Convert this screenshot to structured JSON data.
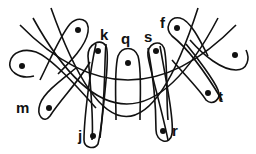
{
  "diagram": {
    "arcs": [
      {
        "name": "inner-arc",
        "path": "M20,25 Q128,135 236,25"
      },
      {
        "name": "middle-arc",
        "path": "M33,18 Q128,190 218,18"
      },
      {
        "name": "outer-arc",
        "path": "M51,8 Q128,225 198,8"
      }
    ],
    "loops": [
      {
        "name": "loop-left",
        "label": "",
        "dot": [
          22,
          66
        ],
        "path": "M34,76 C18,80 8,70 10,62 C12,52 24,48 36,52 C52,58 80,90 96,108"
      },
      {
        "name": "loop-top-left",
        "label": "",
        "dot": [
          78,
          30
        ],
        "path": "M40,80 C50,60 60,36 70,24 C78,16 90,18 88,32 C86,46 70,62 58,74"
      },
      {
        "name": "loop-m",
        "label": "m",
        "dot": [
          49,
          108
        ],
        "label_pos": [
          16,
          113
        ],
        "path": "M90,62 C80,80 60,100 50,116 C44,124 36,116 40,104 C44,92 64,78 76,68"
      },
      {
        "name": "loop-k",
        "label": "k",
        "dot": [
          98,
          51
        ],
        "label_pos": [
          100,
          40
        ],
        "path": "M92,140 C94,120 90,80 88,56 C88,44 100,38 106,46 C110,54 104,100 100,138"
      },
      {
        "name": "loop-j",
        "label": "j",
        "dot": [
          93,
          136
        ],
        "label_pos": [
          77,
          141
        ],
        "path": "M106,44 C104,60 106,110 98,144 C94,150 84,148 84,140 C84,120 90,70 96,44"
      },
      {
        "name": "loop-q",
        "label": "q",
        "dot": [
          128,
          63
        ],
        "label_pos": [
          121,
          44
        ],
        "path": "M116,120 C116,100 114,70 118,56 C122,46 134,46 138,56 C142,70 140,100 140,120"
      },
      {
        "name": "loop-s",
        "label": "s",
        "dot": [
          156,
          51
        ],
        "label_pos": [
          144,
          42
        ],
        "path": "M168,140 C162,110 150,70 148,56 C146,44 160,38 164,48 C168,60 166,100 168,120"
      },
      {
        "name": "loop-r",
        "label": "r",
        "dot": [
          163,
          131
        ],
        "label_pos": [
          172,
          136
        ],
        "path": "M148,48 C154,80 156,110 156,130 C156,142 170,146 172,134 C174,120 166,80 160,46"
      },
      {
        "name": "loop-f",
        "label": "f",
        "dot": [
          177,
          28
        ],
        "label_pos": [
          160,
          28
        ],
        "path": "M222,100 C210,80 190,50 172,36 C164,28 170,16 180,18 C190,20 200,40 208,56"
      },
      {
        "name": "loop-t",
        "label": "t",
        "dot": [
          208,
          93
        ],
        "label_pos": [
          218,
          102
        ],
        "path": "M172,60 C184,74 200,90 206,100 C212,106 222,100 218,90 C214,80 196,56 186,44"
      },
      {
        "name": "loop-right",
        "label": "",
        "dot": [
          235,
          55
        ],
        "label_pos": [
          0,
          0
        ],
        "path": "M190,40 C204,56 222,70 236,70 C248,70 250,58 246,50"
      }
    ],
    "labels": [
      {
        "text": "k",
        "x": 100,
        "y": 40
      },
      {
        "text": "q",
        "x": 121,
        "y": 44
      },
      {
        "text": "s",
        "x": 144,
        "y": 42
      },
      {
        "text": "f",
        "x": 160,
        "y": 28
      },
      {
        "text": "m",
        "x": 16,
        "y": 113
      },
      {
        "text": "j",
        "x": 78,
        "y": 141
      },
      {
        "text": "r",
        "x": 172,
        "y": 136
      },
      {
        "text": "t",
        "x": 218,
        "y": 102
      }
    ]
  }
}
